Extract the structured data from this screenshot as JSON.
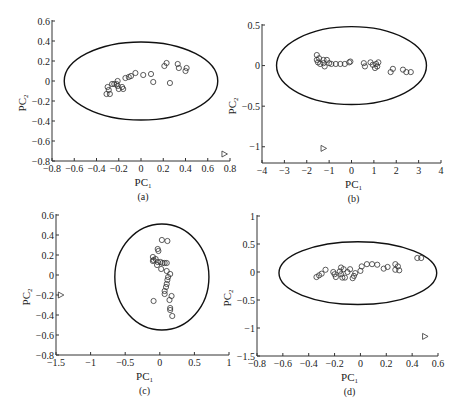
{
  "figure": {
    "panels": [
      "(a)",
      "(b)",
      "(c)",
      "(d)"
    ]
  },
  "chart_data": [
    {
      "type": "scatter",
      "panel_label": "(a)",
      "xlabel": "PC",
      "xlabel_sub": "1",
      "ylabel": "PC",
      "ylabel_sub": "2",
      "xlim": [
        -0.8,
        0.8
      ],
      "ylim": [
        -0.8,
        0.6
      ],
      "xticks": [
        -0.8,
        -0.6,
        -0.4,
        -0.2,
        0,
        0.2,
        0.4,
        0.6,
        0.8
      ],
      "xtick_labels": [
        "−0.8",
        "−0.6",
        "−0.4",
        "−0.2",
        "0",
        "0.2",
        "0.4",
        "0.6",
        "0.8"
      ],
      "yticks": [
        0.6,
        0.4,
        0.2,
        0,
        -0.2,
        -0.4,
        -0.6,
        -0.8
      ],
      "ytick_labels": [
        "0.6",
        "0.4",
        "0.2",
        "0",
        "−0.2",
        "−0.4",
        "−0.6",
        "−0.8"
      ],
      "pixel": {
        "x0": 52,
        "x1": 230,
        "y_top": 21,
        "y_bottom": 161
      },
      "ellipse": {
        "cx": 0.0,
        "cy": 0.0,
        "rx": 0.69,
        "ry": 0.39
      },
      "series": [
        {
          "name": "samples",
          "marker": "circle",
          "points": [
            [
              -0.31,
              -0.13
            ],
            [
              -0.3,
              -0.06
            ],
            [
              -0.29,
              -0.09
            ],
            [
              -0.28,
              -0.13
            ],
            [
              -0.26,
              -0.03
            ],
            [
              -0.24,
              -0.03
            ],
            [
              -0.22,
              -0.03
            ],
            [
              -0.21,
              0.0
            ],
            [
              -0.21,
              -0.05
            ],
            [
              -0.2,
              -0.08
            ],
            [
              -0.17,
              -0.06
            ],
            [
              -0.16,
              -0.08
            ],
            [
              -0.14,
              0.03
            ],
            [
              -0.11,
              0.04
            ],
            [
              -0.09,
              0.05
            ],
            [
              -0.05,
              0.08
            ],
            [
              0.02,
              0.06
            ],
            [
              0.09,
              0.07
            ],
            [
              0.11,
              -0.01
            ],
            [
              0.21,
              0.15
            ],
            [
              0.23,
              0.18
            ],
            [
              0.26,
              -0.02
            ],
            [
              0.33,
              0.17
            ],
            [
              0.34,
              0.13
            ],
            [
              0.4,
              0.1
            ],
            [
              0.41,
              0.13
            ]
          ]
        },
        {
          "name": "outlier",
          "marker": "triangle-right",
          "points": [
            [
              0.75,
              -0.73
            ]
          ]
        }
      ]
    },
    {
      "type": "scatter",
      "panel_label": "(b)",
      "xlabel": "PC",
      "xlabel_sub": "1",
      "ylabel": "PC",
      "ylabel_sub": "2",
      "xlim": [
        -4,
        4
      ],
      "ylim": [
        -1.2,
        0.5
      ],
      "xticks": [
        -4,
        -3,
        -2,
        -1,
        0,
        1,
        2,
        3,
        4
      ],
      "xtick_labels": [
        "−4",
        "−3",
        "−2",
        "−1",
        "0",
        "1",
        "2",
        "3",
        "4"
      ],
      "yticks": [
        0.5,
        0,
        -0.5,
        -1
      ],
      "ytick_labels": [
        "0.5",
        "0",
        "−0.5",
        "−1"
      ],
      "pixel": {
        "x0": 262,
        "x1": 441,
        "y_top": 25,
        "y_bottom": 163
      },
      "ellipse": {
        "cx": 0.0,
        "cy": 0.0,
        "rx": 3.35,
        "ry": 0.48
      },
      "series": [
        {
          "name": "samples",
          "marker": "circle",
          "points": [
            [
              -1.55,
              0.13
            ],
            [
              -1.55,
              0.07
            ],
            [
              -1.5,
              0.04
            ],
            [
              -1.45,
              0.09
            ],
            [
              -1.4,
              0.02
            ],
            [
              -1.25,
              0.07
            ],
            [
              -1.25,
              0.03
            ],
            [
              -1.2,
              -0.01
            ],
            [
              -1.1,
              0.07
            ],
            [
              -1.0,
              0.03
            ],
            [
              -0.9,
              0.02
            ],
            [
              -0.7,
              0.02
            ],
            [
              -0.5,
              0.02
            ],
            [
              -0.3,
              0.02
            ],
            [
              -0.1,
              0.04
            ],
            [
              -0.05,
              0.05
            ],
            [
              0.55,
              0.03
            ],
            [
              0.6,
              -0.01
            ],
            [
              0.85,
              0.04
            ],
            [
              0.95,
              0.01
            ],
            [
              1.05,
              -0.03
            ],
            [
              1.1,
              0.02
            ],
            [
              1.15,
              -0.01
            ],
            [
              1.2,
              0.04
            ],
            [
              1.75,
              -0.08
            ],
            [
              1.85,
              -0.04
            ],
            [
              2.3,
              -0.05
            ],
            [
              2.45,
              -0.08
            ],
            [
              2.65,
              -0.08
            ]
          ]
        },
        {
          "name": "outlier",
          "marker": "triangle-right",
          "points": [
            [
              -1.25,
              -1.02
            ]
          ]
        }
      ]
    },
    {
      "type": "scatter",
      "panel_label": "(c)",
      "xlabel": "PC",
      "xlabel_sub": "1",
      "ylabel": "PC",
      "ylabel_sub": "2",
      "xlim": [
        -1.5,
        1.0
      ],
      "ylim": [
        -0.8,
        0.6
      ],
      "xticks": [
        -1.5,
        -1,
        -0.5,
        0,
        0.5,
        1
      ],
      "xtick_labels": [
        "−1.5",
        "−1",
        "−0.5",
        "0",
        "0.5",
        "1"
      ],
      "yticks": [
        0.6,
        0.4,
        0.2,
        0,
        -0.2,
        -0.4,
        -0.6,
        -0.8
      ],
      "ytick_labels": [
        "0.6",
        "0.4",
        "0.2",
        "0",
        "−0.2",
        "−0.4",
        "−0.6",
        "−0.8"
      ],
      "pixel": {
        "x0": 56,
        "x1": 229,
        "y_top": 215,
        "y_bottom": 355
      },
      "ellipse": {
        "cx": 0.03,
        "cy": -0.02,
        "rx": 0.68,
        "ry": 0.53
      },
      "series": [
        {
          "name": "samples",
          "marker": "circle",
          "points": [
            [
              0.03,
              0.35
            ],
            [
              0.11,
              0.34
            ],
            [
              -0.03,
              0.26
            ],
            [
              -0.02,
              0.24
            ],
            [
              -0.1,
              0.18
            ],
            [
              -0.09,
              0.15
            ],
            [
              -0.06,
              0.16
            ],
            [
              -0.03,
              0.13
            ],
            [
              0.01,
              0.13
            ],
            [
              0.04,
              0.12
            ],
            [
              0.07,
              0.12
            ],
            [
              0.1,
              0.12
            ],
            [
              -0.1,
              0.14
            ],
            [
              -0.04,
              0.1
            ],
            [
              0.02,
              0.06
            ],
            [
              0.1,
              0.04
            ],
            [
              0.15,
              0.01
            ],
            [
              0.12,
              -0.02
            ],
            [
              0.11,
              -0.05
            ],
            [
              0.1,
              -0.09
            ],
            [
              0.09,
              -0.12
            ],
            [
              0.07,
              -0.16
            ],
            [
              0.07,
              -0.19
            ],
            [
              0.17,
              -0.21
            ],
            [
              0.14,
              -0.25
            ],
            [
              -0.09,
              -0.26
            ],
            [
              0.15,
              -0.33
            ],
            [
              0.15,
              -0.35
            ],
            [
              0.18,
              -0.41
            ]
          ]
        },
        {
          "name": "outlier",
          "marker": "triangle-right",
          "points": [
            [
              -1.43,
              -0.2
            ]
          ]
        }
      ]
    },
    {
      "type": "scatter",
      "panel_label": "(d)",
      "xlabel": "PC",
      "xlabel_sub": "1",
      "ylabel": "PC",
      "ylabel_sub": "2",
      "xlim": [
        -0.8,
        0.6
      ],
      "ylim": [
        -1.5,
        1.0
      ],
      "xticks": [
        -0.8,
        -0.6,
        -0.4,
        -0.2,
        0,
        0.2,
        0.4,
        0.6
      ],
      "xtick_labels": [
        "−0.8",
        "−0.6",
        "−0.4",
        "−0.2",
        "0",
        "0.2",
        "0.4",
        "0.6"
      ],
      "yticks": [
        1,
        0.5,
        0,
        -0.5,
        -1,
        -1.5
      ],
      "ytick_labels": [
        "1",
        "0.5",
        "0",
        "−0.5",
        "−1",
        "−1.5"
      ],
      "pixel": {
        "x0": 257,
        "x1": 438,
        "y_top": 216,
        "y_bottom": 356
      },
      "ellipse": {
        "cx": -0.02,
        "cy": -0.02,
        "rx": 0.61,
        "ry": 0.56
      },
      "series": [
        {
          "name": "samples",
          "marker": "circle",
          "points": [
            [
              -0.34,
              -0.09
            ],
            [
              -0.32,
              -0.06
            ],
            [
              -0.3,
              -0.03
            ],
            [
              -0.27,
              0.04
            ],
            [
              -0.21,
              0.0
            ],
            [
              -0.2,
              -0.04
            ],
            [
              -0.19,
              -0.09
            ],
            [
              -0.16,
              0.01
            ],
            [
              -0.15,
              0.08
            ],
            [
              -0.15,
              -0.04
            ],
            [
              -0.14,
              -0.1
            ],
            [
              -0.13,
              0.05
            ],
            [
              -0.12,
              -0.1
            ],
            [
              -0.1,
              0.0
            ],
            [
              -0.08,
              0.05
            ],
            [
              -0.06,
              -0.11
            ],
            [
              -0.05,
              -0.07
            ],
            [
              -0.04,
              -0.02
            ],
            [
              0.0,
              0.02
            ],
            [
              0.01,
              0.1
            ],
            [
              0.05,
              0.14
            ],
            [
              0.09,
              0.14
            ],
            [
              0.13,
              0.13
            ],
            [
              0.18,
              0.06
            ],
            [
              0.21,
              0.09
            ],
            [
              0.27,
              0.14
            ],
            [
              0.27,
              0.04
            ],
            [
              0.29,
              0.1
            ],
            [
              0.3,
              0.03
            ],
            [
              0.44,
              0.25
            ],
            [
              0.47,
              0.25
            ]
          ]
        },
        {
          "name": "outlier",
          "marker": "triangle-right",
          "points": [
            [
              0.5,
              -1.15
            ]
          ]
        }
      ]
    }
  ]
}
